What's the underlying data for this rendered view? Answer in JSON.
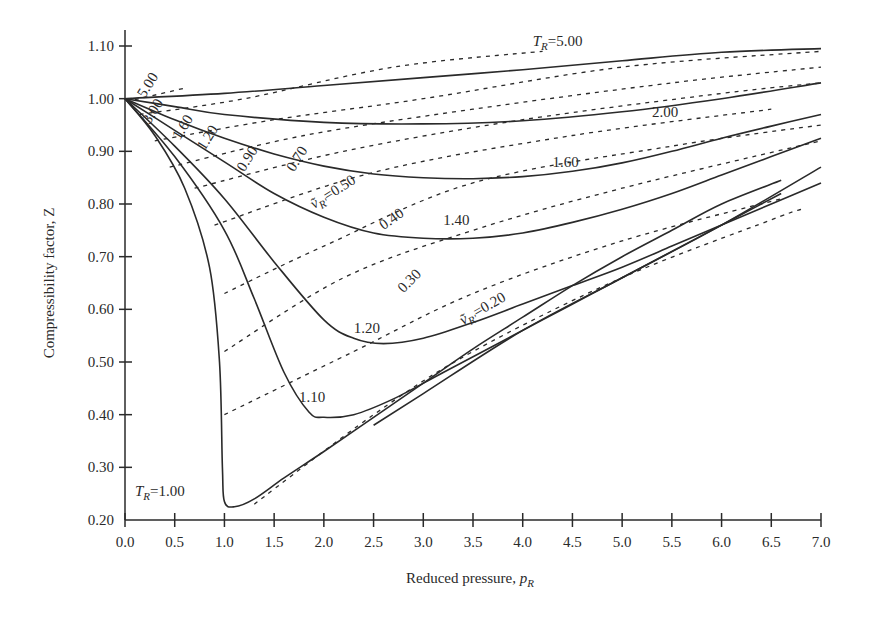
{
  "chart_data": {
    "type": "line",
    "title": "",
    "xlabel": "Reduced pressure, p_R",
    "ylabel": "Compressibility factor, Z",
    "xlim": [
      0.0,
      7.0
    ],
    "ylim": [
      0.2,
      1.1
    ],
    "grid": false,
    "legend": "none (curves labeled inline)",
    "x_ticks": [
      "0.0",
      "0.5",
      "1.0",
      "1.5",
      "2.0",
      "2.5",
      "3.0",
      "3.5",
      "4.0",
      "4.5",
      "5.0",
      "5.5",
      "6.0",
      "6.5",
      "7.0"
    ],
    "y_ticks": [
      "0.20",
      "0.30",
      "0.40",
      "0.50",
      "0.60",
      "0.70",
      "0.80",
      "0.90",
      "1.00",
      "1.10"
    ],
    "series": [
      {
        "name": "T_R=5.00",
        "style": "solid",
        "label": "T_R=5.00",
        "points": [
          [
            0,
            1.0
          ],
          [
            1,
            1.01
          ],
          [
            2,
            1.025
          ],
          [
            3,
            1.04
          ],
          [
            4,
            1.055
          ],
          [
            5,
            1.072
          ],
          [
            6,
            1.088
          ],
          [
            7,
            1.095
          ]
        ]
      },
      {
        "name": "T_R=2.00",
        "style": "solid",
        "label": "2.00",
        "points": [
          [
            0,
            1.0
          ],
          [
            0.5,
            0.985
          ],
          [
            1,
            0.97
          ],
          [
            2,
            0.955
          ],
          [
            3,
            0.952
          ],
          [
            4,
            0.958
          ],
          [
            5,
            0.975
          ],
          [
            6,
            1.0
          ],
          [
            7,
            1.03
          ]
        ]
      },
      {
        "name": "T_R=1.60",
        "style": "solid",
        "label": "1.60",
        "points": [
          [
            0,
            1.0
          ],
          [
            0.5,
            0.96
          ],
          [
            1,
            0.925
          ],
          [
            1.5,
            0.895
          ],
          [
            2,
            0.872
          ],
          [
            2.5,
            0.857
          ],
          [
            3,
            0.85
          ],
          [
            3.5,
            0.848
          ],
          [
            4,
            0.852
          ],
          [
            4.5,
            0.862
          ],
          [
            5,
            0.878
          ],
          [
            5.5,
            0.9
          ],
          [
            6,
            0.925
          ],
          [
            6.5,
            0.948
          ],
          [
            7,
            0.97
          ]
        ]
      },
      {
        "name": "T_R=1.40",
        "style": "solid",
        "label": "1.40",
        "points": [
          [
            0,
            1.0
          ],
          [
            0.5,
            0.94
          ],
          [
            1,
            0.88
          ],
          [
            1.5,
            0.82
          ],
          [
            2,
            0.775
          ],
          [
            2.5,
            0.745
          ],
          [
            3,
            0.735
          ],
          [
            3.5,
            0.735
          ],
          [
            4,
            0.745
          ],
          [
            4.5,
            0.765
          ],
          [
            5,
            0.79
          ],
          [
            5.5,
            0.82
          ],
          [
            6,
            0.855
          ],
          [
            6.5,
            0.89
          ],
          [
            7,
            0.925
          ]
        ]
      },
      {
        "name": "T_R=1.20",
        "style": "solid",
        "label": "1.20",
        "points": [
          [
            0,
            1.0
          ],
          [
            0.5,
            0.91
          ],
          [
            1,
            0.81
          ],
          [
            1.5,
            0.69
          ],
          [
            2,
            0.58
          ],
          [
            2.3,
            0.545
          ],
          [
            2.6,
            0.535
          ],
          [
            3,
            0.545
          ],
          [
            3.5,
            0.575
          ],
          [
            4,
            0.61
          ],
          [
            4.5,
            0.645
          ],
          [
            5,
            0.68
          ],
          [
            5.5,
            0.72
          ],
          [
            6,
            0.76
          ],
          [
            6.5,
            0.8
          ],
          [
            7,
            0.84
          ]
        ]
      },
      {
        "name": "T_R=1.10",
        "style": "solid",
        "label": "1.10",
        "points": [
          [
            0,
            1.0
          ],
          [
            0.5,
            0.89
          ],
          [
            1,
            0.75
          ],
          [
            1.3,
            0.62
          ],
          [
            1.6,
            0.48
          ],
          [
            1.85,
            0.405
          ],
          [
            2,
            0.395
          ],
          [
            2.3,
            0.4
          ],
          [
            2.7,
            0.43
          ],
          [
            3.2,
            0.48
          ],
          [
            3.7,
            0.53
          ],
          [
            4.2,
            0.58
          ],
          [
            4.7,
            0.63
          ],
          [
            5.2,
            0.68
          ],
          [
            5.7,
            0.73
          ],
          [
            6.2,
            0.78
          ],
          [
            6.6,
            0.82
          ]
        ]
      },
      {
        "name": "T_R=1.00",
        "style": "solid",
        "label": "T_R=1.00",
        "points": [
          [
            0,
            1.0
          ],
          [
            0.3,
            0.93
          ],
          [
            0.6,
            0.83
          ],
          [
            0.85,
            0.68
          ],
          [
            0.95,
            0.5
          ],
          [
            0.98,
            0.3
          ],
          [
            1.0,
            0.235
          ],
          [
            1.1,
            0.225
          ],
          [
            1.3,
            0.24
          ],
          [
            1.6,
            0.28
          ],
          [
            2,
            0.33
          ],
          [
            2.5,
            0.395
          ],
          [
            3,
            0.46
          ],
          [
            3.5,
            0.525
          ],
          [
            4,
            0.585
          ],
          [
            4.5,
            0.645
          ],
          [
            5,
            0.7
          ],
          [
            5.5,
            0.75
          ],
          [
            6,
            0.8
          ],
          [
            6.6,
            0.845
          ]
        ]
      },
      {
        "name": "T_R=1.00 (extension)",
        "style": "solid",
        "label": "",
        "points": [
          [
            2.5,
            0.38
          ],
          [
            3,
            0.44
          ],
          [
            4,
            0.56
          ],
          [
            5,
            0.66
          ],
          [
            6,
            0.76
          ],
          [
            7,
            0.87
          ]
        ]
      }
    ],
    "isochores": [
      {
        "name": "v_R=5.00",
        "style": "dashed",
        "label": "5.00",
        "points": [
          [
            0.1,
            0.998
          ],
          [
            0.6,
            1.02
          ]
        ]
      },
      {
        "name": "v_R=3.00",
        "style": "dashed",
        "label": "3.00",
        "points": [
          [
            0.15,
            0.97
          ],
          [
            1.2,
            1.0
          ],
          [
            2.7,
            1.06
          ],
          [
            4.2,
            1.09
          ]
        ]
      },
      {
        "name": "v_R=1.60",
        "style": "dashed",
        "label": "1.60",
        "points": [
          [
            0.3,
            0.92
          ],
          [
            1.5,
            0.96
          ],
          [
            3,
            1.0
          ],
          [
            5,
            1.06
          ],
          [
            7,
            1.09
          ]
        ]
      },
      {
        "name": "v_R=1.20",
        "style": "dashed",
        "label": "1.20",
        "points": [
          [
            0.45,
            0.87
          ],
          [
            1.8,
            0.93
          ],
          [
            3.5,
            0.98
          ],
          [
            5.5,
            1.03
          ],
          [
            7,
            1.06
          ]
        ]
      },
      {
        "name": "v_R=0.90",
        "style": "dashed",
        "label": "0.90",
        "points": [
          [
            0.7,
            0.83
          ],
          [
            2.2,
            0.9
          ],
          [
            4,
            0.96
          ],
          [
            6,
            1.01
          ],
          [
            7,
            1.03
          ]
        ]
      },
      {
        "name": "v_R=0.70",
        "style": "dashed",
        "label": "0.70",
        "points": [
          [
            0.9,
            0.76
          ],
          [
            2.5,
            0.86
          ],
          [
            4.5,
            0.93
          ],
          [
            6.5,
            0.98
          ]
        ]
      },
      {
        "name": "v_R=0.50",
        "style": "dashed",
        "label": "v_R'=0.50",
        "points": [
          [
            1.0,
            0.63
          ],
          [
            2.0,
            0.72
          ],
          [
            3.5,
            0.84
          ],
          [
            5.5,
            0.91
          ],
          [
            7,
            0.95
          ]
        ]
      },
      {
        "name": "v_R=0.40",
        "style": "dashed",
        "label": "0.40",
        "points": [
          [
            1.0,
            0.52
          ],
          [
            2.2,
            0.66
          ],
          [
            3.5,
            0.75
          ],
          [
            5,
            0.83
          ],
          [
            7,
            0.92
          ]
        ]
      },
      {
        "name": "v_R=0.30",
        "style": "dashed",
        "label": "0.30",
        "points": [
          [
            1.0,
            0.4
          ],
          [
            2.3,
            0.52
          ],
          [
            3.5,
            0.63
          ],
          [
            5,
            0.73
          ],
          [
            6.6,
            0.81
          ]
        ]
      },
      {
        "name": "v_R=0.20",
        "style": "dashed",
        "label": "v_R'=0.20",
        "points": [
          [
            1.3,
            0.23
          ],
          [
            2.5,
            0.4
          ],
          [
            3.5,
            0.52
          ],
          [
            5,
            0.66
          ],
          [
            6.5,
            0.77
          ],
          [
            6.8,
            0.79
          ]
        ]
      }
    ],
    "annotations": [
      {
        "text": "T_R=5.00",
        "x": 4.1,
        "y": 1.1
      },
      {
        "text": "2.00",
        "x": 5.3,
        "y": 0.965
      },
      {
        "text": "1.60",
        "x": 4.3,
        "y": 0.87
      },
      {
        "text": "1.40",
        "x": 3.2,
        "y": 0.76
      },
      {
        "text": "1.20",
        "x": 2.3,
        "y": 0.555
      },
      {
        "text": "1.10",
        "x": 1.75,
        "y": 0.425
      },
      {
        "text": "T_R=1.00",
        "x": 0.1,
        "y": 0.245
      },
      {
        "text": "v_R'=0.50",
        "x": 1.9,
        "y": 0.79
      },
      {
        "text": "0.40",
        "x": 2.6,
        "y": 0.75
      },
      {
        "text": "0.30",
        "x": 2.8,
        "y": 0.63
      },
      {
        "text": "v_R'=0.20",
        "x": 3.4,
        "y": 0.57
      },
      {
        "text": "0.70",
        "x": 1.7,
        "y": 0.86
      },
      {
        "text": "0.90",
        "x": 1.2,
        "y": 0.86
      },
      {
        "text": "1.20",
        "x": 0.8,
        "y": 0.9
      },
      {
        "text": "1.60",
        "x": 0.55,
        "y": 0.92
      },
      {
        "text": "3.00",
        "x": 0.25,
        "y": 0.95
      },
      {
        "text": "5.00",
        "x": 0.2,
        "y": 1.0
      }
    ]
  },
  "axes": {
    "x_title_main": "Reduced pressure, ",
    "x_title_var": "p",
    "x_title_sub": "R",
    "y_title": "Compressibility factor, Z"
  }
}
